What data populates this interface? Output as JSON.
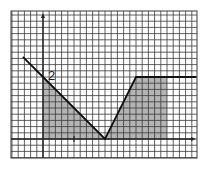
{
  "chart_data": {
    "type": "line",
    "title": "",
    "xlabel": "",
    "ylabel": "",
    "grid": true,
    "grid_cells_per_unit": 5,
    "xlim": [
      -1.05,
      4.95
    ],
    "ylim": [
      -0.6,
      4.1
    ],
    "x_ticks": [
      1
    ],
    "annotations": [
      {
        "text": "2",
        "x": 0.3,
        "y": 2,
        "meaning": "y-intercept value"
      }
    ],
    "series": [
      {
        "name": "f(x)",
        "points": [
          [
            -0.65,
            2.65
          ],
          [
            0,
            2
          ],
          [
            2,
            0
          ],
          [
            3,
            2
          ],
          [
            4.95,
            2
          ]
        ]
      }
    ],
    "shaded_region": {
      "description": "area under the graph from x=0 to x=4",
      "x_from": 0,
      "x_to": 4,
      "boundary": [
        [
          0,
          0
        ],
        [
          0,
          2
        ],
        [
          2,
          0
        ],
        [
          3,
          2
        ],
        [
          4,
          2
        ],
        [
          4,
          0
        ]
      ]
    }
  },
  "labels": {
    "intercept": "2"
  },
  "colors": {
    "grid": "#3a3a3a",
    "shade": "#b4b4b4",
    "line": "#111111",
    "background": "#ffffff"
  }
}
